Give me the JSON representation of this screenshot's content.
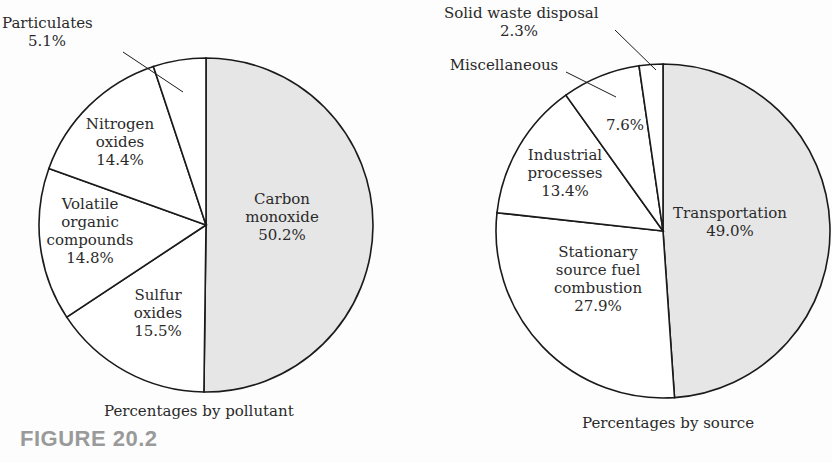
{
  "figure_label": "FIGURE 20.2",
  "chart_data": [
    {
      "type": "pie",
      "title": "Percentages by pollutant",
      "categories": [
        "Carbon monoxide",
        "Sulfur oxides",
        "Volatile organic compounds",
        "Nitrogen oxides",
        "Particulates"
      ],
      "values": [
        50.2,
        15.5,
        14.8,
        14.4,
        5.1
      ],
      "labels": [
        "Carbon monoxide 50.2%",
        "Sulfur oxides 15.5%",
        "Volatile organic compounds 14.8%",
        "Nitrogen oxides 14.4%",
        "Particulates 5.1%"
      ],
      "highlight": "Carbon monoxide",
      "highlight_color": "#e6e6e6"
    },
    {
      "type": "pie",
      "title": "Percentages by source",
      "categories": [
        "Transportation",
        "Stationary source fuel combustion",
        "Industrial processes",
        "Miscellaneous",
        "Solid waste disposal"
      ],
      "values": [
        49.0,
        27.9,
        13.4,
        7.6,
        2.3
      ],
      "labels": [
        "Transportation 49.0%",
        "Stationary source fuel combustion 27.9%",
        "Industrial processes 13.4%",
        "Miscellaneous 7.6%",
        "Solid waste disposal 2.3%"
      ],
      "highlight": "Transportation",
      "highlight_color": "#e6e6e6"
    }
  ],
  "left": {
    "caption": "Percentages by pollutant",
    "carbon": {
      "l1": "Carbon",
      "l2": "monoxide",
      "pct": "50.2%"
    },
    "sulfur": {
      "l1": "Sulfur",
      "l2": "oxides",
      "pct": "15.5%"
    },
    "voc": {
      "l1": "Volatile",
      "l2": "organic",
      "l3": "compounds",
      "pct": "14.8%"
    },
    "nitrogen": {
      "l1": "Nitrogen",
      "l2": "oxides",
      "pct": "14.4%"
    },
    "particulates": {
      "l1": "Particulates",
      "pct": "5.1%"
    }
  },
  "right": {
    "caption": "Percentages by source",
    "transport": {
      "l1": "Transportation",
      "pct": "49.0%"
    },
    "stationary": {
      "l1": "Stationary",
      "l2": "source fuel",
      "l3": "combustion",
      "pct": "27.9%"
    },
    "industrial": {
      "l1": "Industrial",
      "l2": "processes",
      "pct": "13.4%"
    },
    "misc": {
      "l1": "Miscellaneous",
      "pct": "7.6%"
    },
    "solid": {
      "l1": "Solid waste disposal",
      "pct": "2.3%"
    }
  }
}
